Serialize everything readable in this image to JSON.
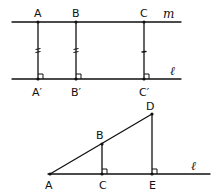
{
  "figure_top": {
    "lines": {
      "m": {
        "label": "m",
        "y": 22,
        "x1": 12,
        "x2": 181
      },
      "l": {
        "label": "ℓ",
        "y": 79,
        "x1": 12,
        "x2": 181
      }
    },
    "points": [
      {
        "id": "A",
        "label": "A",
        "x": 38,
        "y": 22
      },
      {
        "id": "B",
        "label": "B",
        "x": 76,
        "y": 22
      },
      {
        "id": "C",
        "label": "C",
        "x": 144,
        "y": 22
      },
      {
        "id": "A_prime",
        "label": "A′",
        "x": 38,
        "y": 79
      },
      {
        "id": "B_prime",
        "label": "B′",
        "x": 76,
        "y": 79
      },
      {
        "id": "C_prime",
        "label": "C′",
        "x": 144,
        "y": 79
      }
    ],
    "segments": [
      {
        "from": "A",
        "to": "A_prime",
        "tick": "double"
      },
      {
        "from": "B",
        "to": "B_prime",
        "tick": "double"
      },
      {
        "from": "C",
        "to": "C_prime",
        "tick": "single"
      }
    ],
    "right_angles": [
      "A_prime",
      "B_prime",
      "C_prime"
    ]
  },
  "figure_bottom": {
    "lines": {
      "l": {
        "label": "ℓ",
        "y": 174,
        "x1": 48,
        "x2": 210
      }
    },
    "points": [
      {
        "id": "A",
        "label": "A",
        "x": 50,
        "y": 174
      },
      {
        "id": "B",
        "label": "B",
        "x": 102,
        "y": 144
      },
      {
        "id": "C",
        "label": "C",
        "x": 102,
        "y": 174
      },
      {
        "id": "D",
        "label": "D",
        "x": 152,
        "y": 114
      },
      {
        "id": "E",
        "label": "E",
        "x": 152,
        "y": 174
      }
    ],
    "segments": [
      {
        "from": "A",
        "to": "D"
      },
      {
        "from": "B",
        "to": "C"
      },
      {
        "from": "D",
        "to": "E"
      }
    ],
    "right_angles": [
      "C",
      "E"
    ]
  },
  "colors": {
    "ink": "#111111",
    "background": "#ffffff"
  }
}
